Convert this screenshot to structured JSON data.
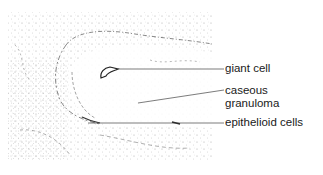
{
  "figure": {
    "labels": [
      {
        "id": "giant-cell",
        "lines": [
          "giant cell"
        ]
      },
      {
        "id": "caseous-granuloma",
        "lines": [
          "caseous",
          "granuloma"
        ]
      },
      {
        "id": "epithelioid-cells",
        "lines": [
          "epithelioid cells"
        ]
      }
    ]
  }
}
